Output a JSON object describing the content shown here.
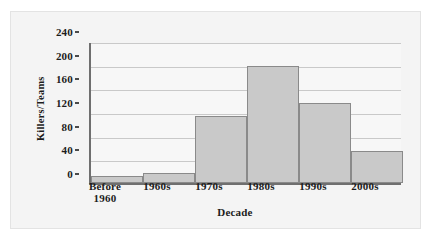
{
  "chart_data": {
    "type": "bar",
    "title": "",
    "xlabel": "Decade",
    "ylabel": "Killers/Teams",
    "categories": [
      "Before 1960",
      "1960s",
      "1970s",
      "1980s",
      "1990s",
      "2000s"
    ],
    "category_lines": [
      [
        "Before",
        "1960"
      ],
      [
        "1960s"
      ],
      [
        "1970s"
      ],
      [
        "1980s"
      ],
      [
        "1990s"
      ],
      [
        "2000s"
      ]
    ],
    "values": [
      12,
      17,
      113,
      197,
      135,
      54
    ],
    "ylim": [
      0,
      240
    ],
    "yticks": [
      0,
      40,
      80,
      120,
      160,
      200,
      240
    ],
    "ytick_labels": [
      "0",
      "40",
      "80",
      "120",
      "160",
      "200",
      "240"
    ],
    "grid": true,
    "legend": "none",
    "colors": {
      "bar_fill": "#c9c9c9",
      "bar_stroke": "#8a8a8a",
      "axis": "#6f6f6f",
      "gridline": "#c9c9c9",
      "text": "#1c1c1c",
      "plot_background": "#f7f7f7",
      "figure_background": "#f4f4f4"
    }
  }
}
